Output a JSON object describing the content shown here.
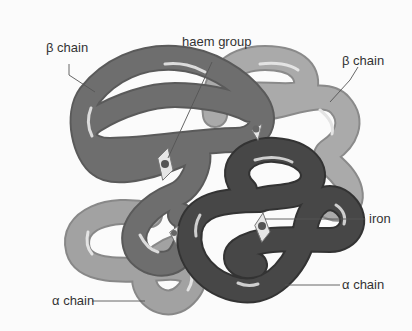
{
  "diagram": {
    "labels": {
      "beta_chain_left": "β chain",
      "haem_group": "haem group",
      "beta_chain_right": "β chain",
      "iron": "iron",
      "alpha_chain_left": "α chain",
      "alpha_chain_right": "α chain"
    },
    "colors": {
      "beta_left": "#6e6e6e",
      "beta_right": "#a9a9a9",
      "alpha_left": "#9a9a9a",
      "alpha_right": "#454545",
      "highlight": "#e8e8e8",
      "leader_line": "#555555"
    }
  }
}
